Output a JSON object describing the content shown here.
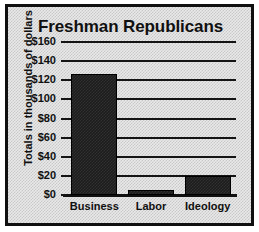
{
  "chart_data": {
    "type": "bar",
    "title": "Freshman Republicans",
    "xlabel": "",
    "ylabel": "Totals in thousands of dollars",
    "categories": [
      "Business",
      "Labor",
      "Ideology"
    ],
    "values": [
      127,
      5,
      20
    ],
    "ylim": [
      0,
      160
    ],
    "ytick_values": [
      0,
      20,
      40,
      60,
      80,
      100,
      120,
      140,
      160
    ],
    "ytick_labels": [
      "$0",
      "$20",
      "$40",
      "$60",
      "$80",
      "$100",
      "$120",
      "$140",
      "$160"
    ],
    "grid": true,
    "legend": false,
    "series": [
      {
        "name": "Totals",
        "values": [
          127,
          5,
          20
        ]
      }
    ],
    "colors": {
      "bar_fill": "#1c1c1c",
      "background": "#e9e9e9",
      "border": "#101010",
      "gridline": "#141414",
      "text": "#101010"
    }
  }
}
